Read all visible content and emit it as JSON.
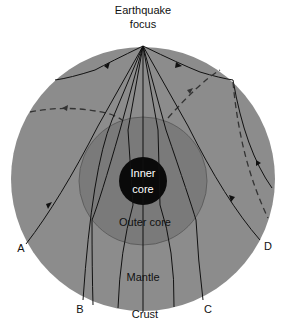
{
  "title": "Earthquake focus",
  "labels": {
    "focus_line1": "Earthquake",
    "focus_line2": "focus",
    "inner_core_line1": "Inner",
    "inner_core_line2": "core",
    "outer_core": "Outer core",
    "mantle": "Mantle",
    "crust": "Crust",
    "station_a": "A",
    "station_b": "B",
    "station_c": "C",
    "station_d": "D"
  },
  "colors": {
    "mantle": "#8c8c8c",
    "outer_core": "#7a7a7a",
    "inner_core": "#0a0a0a",
    "lines": "#111111",
    "background": "#ffffff"
  },
  "legend_hint": {
    "solid_line": "P-wave path",
    "dashed_line": "S-wave path"
  }
}
